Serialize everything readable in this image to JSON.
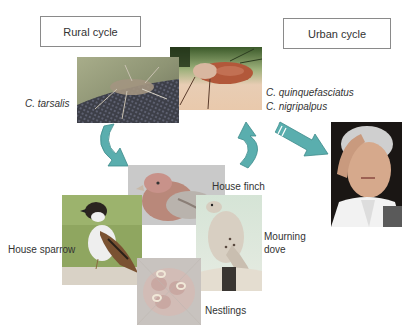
{
  "diagram": {
    "rural_cycle": {
      "label": "Rural cycle"
    },
    "urban_cycle": {
      "label": "Urban cycle"
    },
    "vectors": {
      "rural": {
        "species": "C. tarsalis"
      },
      "urban": {
        "species": [
          "C. quinquefasciatus",
          "C. nigripalpus"
        ]
      }
    },
    "hosts": {
      "house_finch": "House finch",
      "house_sparrow": "House sparrow",
      "mourning_dove": [
        "Mourning",
        "dove"
      ],
      "nestlings": "Nestlings"
    },
    "images": {
      "mosquito_rural": "mosquito-photo",
      "mosquito_urban": "engorged-mosquito-photo",
      "person": "sick-woman-photo",
      "house_sparrow": "house-sparrow-photo",
      "house_finch": "house-finch-photo",
      "mourning_dove": "mourning-dove-photo",
      "nestlings": "nestlings-photo"
    },
    "arrows": {
      "color": "#5aaeae",
      "items": [
        "mosquito-to-birds-curved-arrow",
        "birds-to-mosquito-curved-arrow",
        "mosquito-to-human-arrow"
      ]
    }
  }
}
